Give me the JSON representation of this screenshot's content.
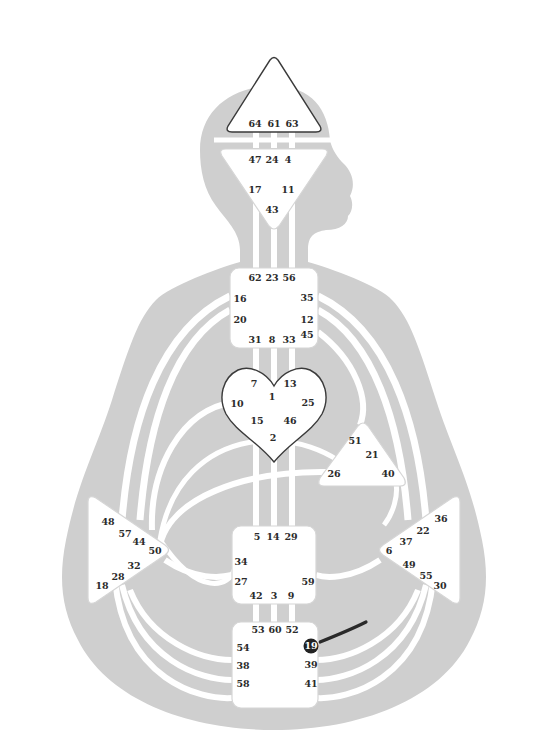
{
  "diagram": {
    "type": "human-design-bodygraph",
    "colors": {
      "silhouette": "#cfcfcf",
      "channel": "#ffffff",
      "center_fill": "#ffffff",
      "center_outline_defined": "#3a3a3a",
      "active_gate": "#222222",
      "active_channel": "#2a2a2a"
    },
    "centers": {
      "head": {
        "name": "Head",
        "shape": "triangle-up",
        "defined": true,
        "gates": [
          "64",
          "61",
          "63"
        ]
      },
      "ajna": {
        "name": "Ajna",
        "shape": "triangle-down",
        "defined": false,
        "gates": [
          "47",
          "24",
          "4",
          "17",
          "11",
          "43"
        ]
      },
      "throat": {
        "name": "Throat",
        "shape": "square",
        "defined": false,
        "gates": [
          "62",
          "23",
          "56",
          "16",
          "35",
          "20",
          "12",
          "45",
          "31",
          "8",
          "33"
        ]
      },
      "g": {
        "name": "G / Identity",
        "shape": "heart",
        "defined": true,
        "gates": [
          "7",
          "13",
          "1",
          "10",
          "25",
          "15",
          "46",
          "2"
        ]
      },
      "heart": {
        "name": "Heart / Ego",
        "shape": "triangle",
        "defined": false,
        "gates": [
          "51",
          "21",
          "26",
          "40"
        ]
      },
      "spleen": {
        "name": "Spleen",
        "shape": "triangle-right",
        "defined": false,
        "gates": [
          "48",
          "57",
          "44",
          "50",
          "32",
          "28",
          "18"
        ]
      },
      "sacral": {
        "name": "Sacral",
        "shape": "square",
        "defined": false,
        "gates": [
          "5",
          "14",
          "29",
          "34",
          "27",
          "59",
          "42",
          "3",
          "9"
        ]
      },
      "solar": {
        "name": "Solar Plexus",
        "shape": "triangle-left",
        "defined": false,
        "gates": [
          "36",
          "22",
          "37",
          "6",
          "49",
          "55",
          "30"
        ]
      },
      "root": {
        "name": "Root",
        "shape": "square",
        "defined": false,
        "gates": [
          "53",
          "60",
          "52",
          "54",
          "19",
          "38",
          "39",
          "58",
          "41"
        ]
      }
    },
    "active_gates": [
      "19"
    ],
    "active_channel_segment": {
      "from_gate": "19",
      "toward": "49"
    }
  }
}
